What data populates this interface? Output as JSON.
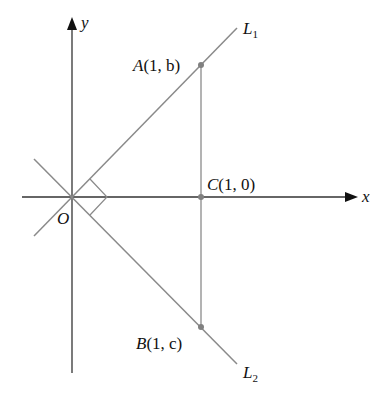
{
  "diagram": {
    "axes": {
      "x_label": "x",
      "y_label": "y",
      "origin_label": "O"
    },
    "lines": [
      {
        "name": "L",
        "subscript": "1"
      },
      {
        "name": "L",
        "subscript": "2"
      }
    ],
    "points": {
      "A": {
        "name": "A",
        "coords": "(1, b)",
        "x": "1",
        "y": "b"
      },
      "B": {
        "name": "B",
        "coords": "(1, c)",
        "x": "1",
        "y": "c"
      },
      "C": {
        "name": "C",
        "coords": "(1, 0)",
        "x": "1",
        "y": "0"
      }
    },
    "annotations": {
      "right_angle_at": "O"
    },
    "colors": {
      "axis": "#222222",
      "line": "#8a8a8a",
      "point": "#808080"
    }
  }
}
